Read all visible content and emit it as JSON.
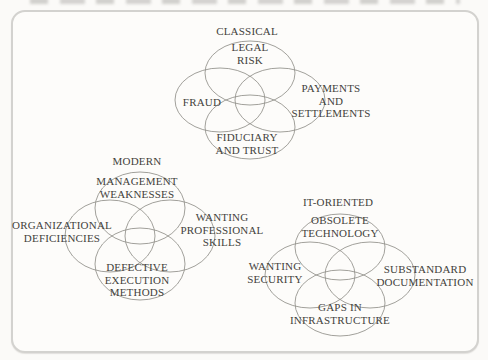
{
  "figure": {
    "diagrams": [
      {
        "title": "CLASSICAL",
        "circles": {
          "top": "LEGAL\nRISK",
          "left": "FRAUD",
          "right": "PAYMENTS\nAND\nSETTLEMENTS",
          "bottom": "FIDUCIARY\nAND TRUST"
        }
      },
      {
        "title": "MODERN",
        "circles": {
          "top": "MANAGEMENT\nWEAKNESSES",
          "left": "ORGANIZATIONAL\nDEFICIENCIES",
          "right": "WANTING\nPROFESSIONAL\nSKILLS",
          "bottom": "DEFECTIVE\nEXECUTION\nMETHODS"
        }
      },
      {
        "title": "IT-ORIENTED",
        "circles": {
          "top": "OBSOLETE\nTECHNOLOGY",
          "left": "WANTING\nSECURITY",
          "right": "SUBSTANDARD\nDOCUMENTATION",
          "bottom": "GAPS IN\nINFRASTRUCTURE"
        }
      }
    ],
    "colors": {
      "ellipse_stroke": "#85837d",
      "text": "#43423c",
      "frame_border": "#d3d2cf",
      "background": "#fbfaf8"
    }
  }
}
